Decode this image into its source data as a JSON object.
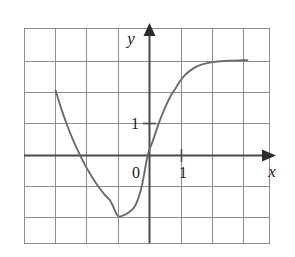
{
  "chart_data": {
    "type": "line",
    "title": "",
    "xlabel": "x",
    "ylabel": "y",
    "xlim": [
      -4.06,
      3.87
    ],
    "ylim": [
      -2.84,
      4.1
    ],
    "grid": true,
    "grid_spacing": 1,
    "legend": null,
    "axis_tick_labels": {
      "origin": "0",
      "x_one": "1",
      "y_one": "1"
    },
    "series": [
      {
        "name": "curve",
        "color": "#6b6b6b",
        "x": [
          -3.03,
          -2.85,
          -2.65,
          -2.45,
          -2.25,
          -2.05,
          -1.85,
          -1.65,
          -1.45,
          -1.25,
          -1.03,
          -0.85,
          -0.65,
          -0.45,
          -0.25,
          -0.06,
          0.1,
          0.25,
          0.4,
          0.55,
          0.7,
          0.85,
          1.0,
          1.15,
          1.3,
          1.5,
          1.7,
          1.9,
          2.1,
          2.3,
          2.6,
          2.9,
          3.16
        ],
        "y": [
          2.1,
          1.52,
          0.96,
          0.46,
          0.03,
          -0.36,
          -0.7,
          -1.0,
          -1.26,
          -1.48,
          -1.94,
          -1.93,
          -1.82,
          -1.6,
          -1.0,
          0.0,
          0.45,
          0.9,
          1.3,
          1.65,
          1.95,
          2.18,
          2.42,
          2.6,
          2.73,
          2.86,
          2.94,
          2.99,
          3.02,
          3.04,
          3.06,
          3.07,
          3.07
        ]
      }
    ]
  },
  "axes": {
    "y_axis_name": "y",
    "x_axis_name": "x"
  },
  "ticks": {
    "zero": "0",
    "x_one": "1",
    "y_one": "1"
  },
  "colors": {
    "curve": "#6b6b6b",
    "grid": "#8c8c93",
    "axis": "#4a4a4a",
    "background": "#ffffff",
    "text": "#1a1a1a"
  }
}
